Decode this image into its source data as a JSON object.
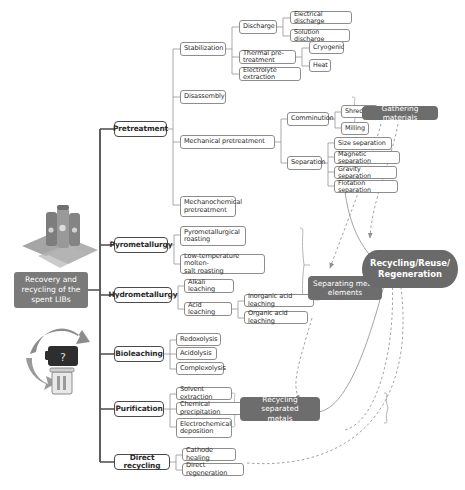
{
  "diagram": {
    "type": "mind-map",
    "title": "Recovery and recycling of the spent LIBs",
    "root": {
      "label": "Recovery and\nrecycling of the\nspent LIBs"
    },
    "branches": [
      {
        "id": "pretreatment",
        "label": "Pretreatment",
        "children": [
          {
            "label": "Stabilization",
            "children": [
              {
                "label": "Discharge",
                "children": [
                  {
                    "label": "Electrical discharge"
                  },
                  {
                    "label": "Solution discharge"
                  }
                ]
              },
              {
                "label": "Thermal pre-treatment",
                "children": [
                  {
                    "label": "Cryogenic"
                  },
                  {
                    "label": "Heat"
                  }
                ]
              },
              {
                "label": "Electrolyte extraction"
              }
            ]
          },
          {
            "label": "Disassembly"
          },
          {
            "label": "Mechanical pretreatment",
            "children": [
              {
                "label": "Comminution",
                "children": [
                  {
                    "label": "Shredding"
                  },
                  {
                    "label": "Milling"
                  }
                ]
              },
              {
                "label": "Separation",
                "children": [
                  {
                    "label": "Size separation"
                  },
                  {
                    "label": "Magnetic separation"
                  },
                  {
                    "label": "Gravity separation"
                  },
                  {
                    "label": "Flotation separation"
                  }
                ]
              }
            ]
          },
          {
            "label": "Mechanochemical\npretreatment"
          }
        ]
      },
      {
        "id": "pyrometallurgy",
        "label": "Pyrometallurgy",
        "children": [
          {
            "label": "Pyrometallurgical\nroasting"
          },
          {
            "label": "Low-temperature molten-\nsalt roasting"
          }
        ]
      },
      {
        "id": "hydrometallurgy",
        "label": "Hydrometallurgy",
        "children": [
          {
            "label": "Alkali leaching"
          },
          {
            "label": "Acid leaching",
            "children": [
              {
                "label": "Inorganic acid leaching"
              },
              {
                "label": "Organic acid leaching"
              }
            ]
          }
        ]
      },
      {
        "id": "bioleaching",
        "label": "Bioleaching",
        "children": [
          {
            "label": "Redoxolysis"
          },
          {
            "label": "Acidolysis"
          },
          {
            "label": "Complexolysis"
          }
        ]
      },
      {
        "id": "purification",
        "label": "Purification",
        "children": [
          {
            "label": "Solvent extraction"
          },
          {
            "label": "Chemical precipitation"
          },
          {
            "label": "Electrochemical\ndeposition"
          }
        ]
      },
      {
        "id": "direct-recycling",
        "label": "Direct recycling",
        "children": [
          {
            "label": "Cathode healing"
          },
          {
            "label": "Direct regeneration"
          }
        ]
      }
    ],
    "outcomes": [
      {
        "id": "gathering-materials",
        "label": "Gathering materials"
      },
      {
        "id": "separating-metal-elements",
        "label": "Separating metal\nelements"
      },
      {
        "id": "recycling-separated-metals",
        "label": "Recycling separated\nmetals"
      },
      {
        "id": "hub",
        "label": "Recycling/Reuse/\nRegeneration"
      }
    ],
    "images": [
      {
        "id": "battery-cells-image",
        "alt": "cylindrical lithium battery cells"
      },
      {
        "id": "battery-recycling-image",
        "alt": "battery recycling symbol with arrows and bin"
      }
    ],
    "colors": {
      "grey_box": "#6d6d6d",
      "root_box": "#7a7a7a",
      "node_border": "#8d8d8d",
      "level1_border": "#4a4a4a",
      "text_dark": "#2b2b2b",
      "text_light": "#ffffff",
      "connector": "#9a9a9a",
      "trunk": "#555555",
      "background": "#ffffff"
    }
  }
}
